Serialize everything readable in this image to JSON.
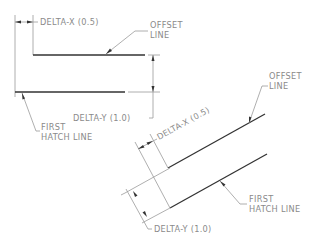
{
  "diagram": {
    "top": {
      "delta_x_label": "DELTA-X (0.5)",
      "offset_label_line1": "OFFSET",
      "offset_label_line2": "LINE",
      "delta_y_label": "DELTA-Y (1.0)",
      "first_hatch_line1": "FIRST",
      "first_hatch_line2": "HATCH LINE"
    },
    "bottom": {
      "delta_x_label": "DELTA-X (0.5)",
      "offset_label_line1": "OFFSET",
      "offset_label_line2": "LINE",
      "delta_y_label": "DELTA-Y (1.0)",
      "first_hatch_line1": "FIRST",
      "first_hatch_line2": "HATCH LINE"
    },
    "colors": {
      "hatch_line": "#333333",
      "dimension_line": "#9a9a9a",
      "text": "#8a8a8a"
    }
  }
}
